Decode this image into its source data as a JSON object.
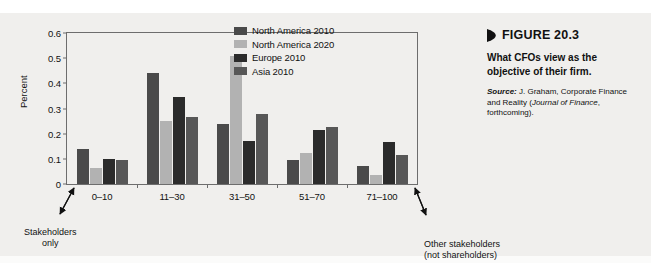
{
  "chart_data": {
    "type": "bar",
    "title": "",
    "xlabel": "",
    "ylabel": "Percent",
    "ylim": [
      0,
      0.6
    ],
    "ytick_labels": [
      "0",
      "0.1",
      "0.2",
      "0.3",
      "0.4",
      "0.5",
      "0.6"
    ],
    "ytick_values": [
      0,
      0.1,
      0.2,
      0.3,
      0.4,
      0.5,
      0.6
    ],
    "grid": false,
    "legend_position": "upper center inside plot",
    "categories": [
      "0–10",
      "11–30",
      "31–50",
      "51–70",
      "71–100"
    ],
    "series": [
      {
        "name": "North America 2010",
        "color": "#4a4a4a",
        "values": [
          0.14,
          0.44,
          0.24,
          0.095,
          0.07
        ]
      },
      {
        "name": "North America 2020",
        "color": "#b2b2b2",
        "values": [
          0.065,
          0.25,
          0.51,
          0.125,
          0.035
        ]
      },
      {
        "name": "Europe 2010",
        "color": "#2b2b2b",
        "values": [
          0.1,
          0.345,
          0.17,
          0.215,
          0.165
        ]
      },
      {
        "name": "Asia 2010",
        "color": "#575757",
        "values": [
          0.095,
          0.265,
          0.28,
          0.225,
          0.115
        ]
      }
    ],
    "annotations": [
      {
        "name": "left-axis-annotation",
        "lines": [
          "Stakeholders",
          "only"
        ]
      },
      {
        "name": "right-axis-annotation",
        "lines": [
          "Other stakeholders",
          "(not shareholders)"
        ]
      }
    ]
  },
  "caption": {
    "figure_marker_icon": "triangle-right-icon",
    "figure_number": "FIGURE 20.3",
    "figure_title": "What CFOs view as the objective of their firm.",
    "source_lead": "Source:",
    "source_text_part1": " J. Graham, Corporate Finance and Reality (",
    "source_italic": "Journal of Finance",
    "source_text_part2": ", forthcoming)."
  },
  "colors": {
    "page_background": "#f0efed",
    "axis": "#6d6d6d",
    "text": "#111111"
  }
}
